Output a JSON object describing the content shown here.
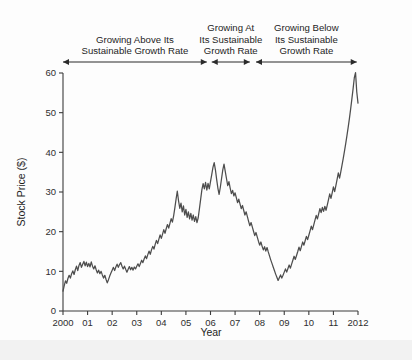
{
  "chart_data": {
    "type": "line",
    "title": "",
    "xlabel": "Year",
    "ylabel": "Stock Price ($)",
    "xlim": [
      2000,
      2012
    ],
    "ylim": [
      0,
      60
    ],
    "grid": false,
    "legend": "none",
    "line_color": "#4d4d4d",
    "axis_color": "#3b3b3b",
    "xticks": [
      2000,
      2001,
      2002,
      2003,
      2004,
      2005,
      2006,
      2007,
      2008,
      2009,
      2010,
      2011,
      2012
    ],
    "xticklabels": [
      "2000",
      "01",
      "02",
      "03",
      "04",
      "05",
      "06",
      "07",
      "08",
      "09",
      "10",
      "11",
      "2012"
    ],
    "yticks": [
      0,
      10,
      20,
      30,
      40,
      50,
      60
    ],
    "yticklabels": [
      "0",
      "10",
      "20",
      "30",
      "40",
      "50",
      "60"
    ],
    "series": [
      {
        "name": "Stock Price",
        "x": [
          2000.0,
          2000.05,
          2000.1,
          2000.15,
          2000.2,
          2000.25,
          2000.3,
          2000.35,
          2000.4,
          2000.45,
          2000.5,
          2000.55,
          2000.6,
          2000.65,
          2000.7,
          2000.75,
          2000.8,
          2000.85,
          2000.9,
          2000.95,
          2001.0,
          2001.05,
          2001.1,
          2001.15,
          2001.2,
          2001.25,
          2001.3,
          2001.35,
          2001.4,
          2001.45,
          2001.5,
          2001.55,
          2001.6,
          2001.65,
          2001.7,
          2001.75,
          2001.8,
          2001.85,
          2001.9,
          2001.95,
          2002.0,
          2002.05,
          2002.1,
          2002.15,
          2002.2,
          2002.25,
          2002.3,
          2002.35,
          2002.4,
          2002.45,
          2002.5,
          2002.55,
          2002.6,
          2002.65,
          2002.7,
          2002.75,
          2002.8,
          2002.85,
          2002.9,
          2002.95,
          2003.0,
          2003.05,
          2003.1,
          2003.15,
          2003.2,
          2003.25,
          2003.3,
          2003.35,
          2003.4,
          2003.45,
          2003.5,
          2003.55,
          2003.6,
          2003.65,
          2003.7,
          2003.75,
          2003.8,
          2003.85,
          2003.9,
          2003.95,
          2004.0,
          2004.05,
          2004.1,
          2004.15,
          2004.2,
          2004.25,
          2004.3,
          2004.35,
          2004.4,
          2004.45,
          2004.5,
          2004.55,
          2004.6,
          2004.65,
          2004.7,
          2004.75,
          2004.8,
          2004.85,
          2004.9,
          2004.95,
          2005.0,
          2005.05,
          2005.1,
          2005.15,
          2005.2,
          2005.25,
          2005.3,
          2005.35,
          2005.4,
          2005.45,
          2005.5,
          2005.55,
          2005.6,
          2005.65,
          2005.7,
          2005.75,
          2005.8,
          2005.85,
          2005.9,
          2005.95,
          2006.0,
          2006.05,
          2006.1,
          2006.15,
          2006.2,
          2006.25,
          2006.3,
          2006.35,
          2006.4,
          2006.45,
          2006.5,
          2006.55,
          2006.6,
          2006.65,
          2006.7,
          2006.75,
          2006.8,
          2006.85,
          2006.9,
          2006.95,
          2007.0,
          2007.05,
          2007.1,
          2007.15,
          2007.2,
          2007.25,
          2007.3,
          2007.35,
          2007.4,
          2007.45,
          2007.5,
          2007.55,
          2007.6,
          2007.65,
          2007.7,
          2007.75,
          2007.8,
          2007.85,
          2007.9,
          2007.95,
          2008.0,
          2008.05,
          2008.1,
          2008.15,
          2008.2,
          2008.25,
          2008.3,
          2008.35,
          2008.4,
          2008.45,
          2008.5,
          2008.55,
          2008.6,
          2008.65,
          2008.7,
          2008.75,
          2008.8,
          2008.85,
          2008.9,
          2008.95,
          2009.0,
          2009.05,
          2009.1,
          2009.15,
          2009.2,
          2009.25,
          2009.3,
          2009.35,
          2009.4,
          2009.45,
          2009.5,
          2009.55,
          2009.6,
          2009.65,
          2009.7,
          2009.75,
          2009.8,
          2009.85,
          2009.9,
          2009.95,
          2010.0,
          2010.05,
          2010.1,
          2010.15,
          2010.2,
          2010.25,
          2010.3,
          2010.35,
          2010.4,
          2010.45,
          2010.5,
          2010.55,
          2010.6,
          2010.65,
          2010.7,
          2010.75,
          2010.8,
          2010.85,
          2010.9,
          2010.95,
          2011.0,
          2011.05,
          2011.1,
          2011.15,
          2011.2,
          2011.25,
          2011.3,
          2011.35,
          2011.4,
          2011.45,
          2011.5,
          2011.55,
          2011.6,
          2011.65,
          2011.7,
          2011.75,
          2011.8,
          2011.85,
          2011.9,
          2011.95,
          2012.0
        ],
        "values": [
          5.0,
          6.4,
          7.6,
          7.0,
          8.2,
          9.0,
          8.3,
          9.4,
          10.1,
          9.2,
          10.4,
          11.3,
          10.2,
          11.5,
          12.2,
          11.0,
          11.8,
          12.5,
          11.4,
          12.3,
          11.2,
          12.0,
          11.1,
          12.4,
          11.3,
          10.6,
          11.4,
          10.4,
          9.6,
          10.3,
          9.4,
          10.0,
          9.1,
          8.3,
          9.0,
          8.0,
          7.1,
          7.9,
          8.8,
          9.6,
          10.3,
          11.0,
          10.2,
          11.1,
          11.8,
          11.0,
          11.7,
          12.2,
          11.3,
          10.6,
          11.3,
          10.5,
          9.8,
          10.5,
          11.2,
          10.4,
          11.0,
          10.3,
          11.1,
          10.6,
          11.3,
          11.9,
          11.2,
          12.0,
          12.8,
          12.2,
          13.1,
          13.9,
          13.2,
          14.2,
          15.1,
          14.3,
          15.4,
          16.3,
          15.6,
          16.8,
          17.8,
          17.0,
          18.1,
          19.2,
          18.3,
          19.4,
          20.5,
          19.6,
          20.8,
          21.8,
          20.9,
          22.1,
          23.3,
          22.4,
          24.0,
          26.0,
          28.2,
          30.2,
          27.8,
          25.9,
          27.2,
          25.0,
          26.5,
          24.2,
          25.6,
          23.6,
          25.0,
          23.2,
          24.6,
          22.9,
          24.2,
          22.6,
          23.8,
          22.3,
          23.5,
          25.8,
          28.2,
          30.6,
          32.1,
          30.8,
          32.4,
          30.5,
          32.2,
          30.8,
          32.6,
          34.4,
          36.2,
          37.4,
          35.6,
          33.2,
          31.0,
          29.4,
          31.2,
          33.4,
          35.6,
          37.0,
          35.2,
          33.4,
          31.6,
          32.6,
          31.0,
          29.6,
          30.4,
          29.0,
          29.8,
          28.6,
          27.3,
          28.2,
          27.0,
          25.8,
          26.6,
          25.4,
          24.2,
          25.0,
          23.8,
          22.6,
          21.5,
          22.3,
          21.2,
          20.1,
          19.0,
          19.8,
          18.7,
          17.6,
          16.6,
          17.4,
          16.3,
          15.4,
          16.2,
          15.1,
          16.0,
          14.9,
          13.9,
          12.9,
          12.0,
          11.1,
          10.2,
          9.3,
          8.5,
          7.7,
          8.4,
          9.1,
          8.3,
          9.0,
          9.8,
          10.6,
          9.8,
          10.7,
          11.6,
          10.8,
          11.8,
          12.8,
          13.8,
          13.0,
          14.0,
          15.0,
          16.1,
          15.2,
          16.3,
          17.4,
          16.6,
          17.7,
          18.8,
          18.0,
          19.1,
          20.2,
          21.4,
          20.5,
          21.7,
          22.9,
          24.1,
          23.2,
          24.5,
          25.8,
          24.8,
          26.1,
          25.1,
          26.4,
          25.4,
          26.7,
          28.1,
          29.5,
          28.4,
          29.8,
          31.3,
          30.1,
          31.6,
          33.2,
          34.8,
          33.5,
          35.1,
          36.8,
          38.5,
          40.3,
          42.2,
          44.2,
          46.3,
          48.5,
          50.9,
          53.4,
          56.0,
          58.8,
          60.1,
          55.2,
          52.4
        ]
      }
    ],
    "annotations": [
      {
        "id": "phase-1",
        "lines": [
          "Growing Above Its",
          "Sustainable Growth Rate"
        ],
        "x_start": 2000.0,
        "x_end": 2005.85,
        "arrow": "double"
      },
      {
        "id": "phase-2",
        "lines": [
          "Growing At",
          "Its Sustainable",
          "Growth Rate"
        ],
        "x_start": 2006.05,
        "x_end": 2007.6,
        "arrow": "double"
      },
      {
        "id": "phase-3",
        "lines": [
          "Growing Below",
          "Its Sustainable",
          "Growth Rate"
        ],
        "x_start": 2007.85,
        "x_end": 2011.95,
        "arrow": "double"
      }
    ]
  }
}
